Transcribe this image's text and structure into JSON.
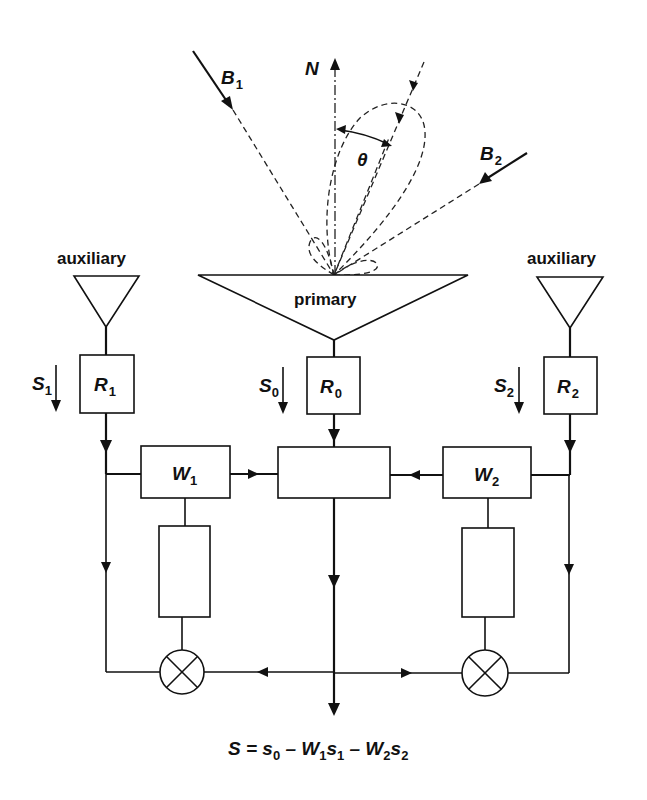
{
  "diagram": {
    "type": "sidelobe-canceller block diagram",
    "top": {
      "normal_label": "N",
      "beam1_label": "B",
      "beam1_sub": "1",
      "beam2_label": "B",
      "beam2_sub": "2",
      "angle_label": "θ"
    },
    "antennas": {
      "left_label": "auxiliary",
      "center_label": "primary",
      "right_label": "auxiliary"
    },
    "receivers": [
      {
        "id": "R1",
        "label": "R",
        "sub": "1",
        "signal": "S",
        "signal_sub": "1"
      },
      {
        "id": "R0",
        "label": "R",
        "sub": "0",
        "signal": "S",
        "signal_sub": "0"
      },
      {
        "id": "R2",
        "label": "R",
        "sub": "2",
        "signal": "S",
        "signal_sub": "2"
      }
    ],
    "weights": [
      {
        "id": "W1",
        "label": "W",
        "sub": "1"
      },
      {
        "id": "W2",
        "label": "W",
        "sub": "2"
      }
    ],
    "output_equation": {
      "parts": [
        {
          "t": "S = s",
          "s": "0"
        },
        {
          "t": " – W",
          "s": "1"
        },
        {
          "t": "s",
          "s": "1"
        },
        {
          "t": " – W",
          "s": "2"
        },
        {
          "t": "s",
          "s": "2"
        }
      ],
      "full": "S = s0 – W1s1 – W2s2"
    }
  }
}
